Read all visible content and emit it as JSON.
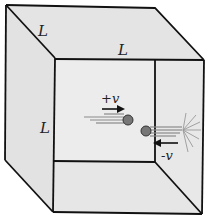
{
  "figure": {
    "type": "cube-gas-molecule-diagram",
    "labels": {
      "edge_top_left": "L",
      "edge_top_front": "L",
      "edge_left_front": "L",
      "velocity_positive": "+v",
      "velocity_negative": "-v"
    },
    "colors": {
      "face_fill": "#e6e6e6",
      "inner_face_fill": "#ebebeb",
      "edge_stroke": "#111111",
      "molecule_fill": "#777777",
      "trail": "#8a8a8a",
      "arrow": "#111111"
    }
  }
}
